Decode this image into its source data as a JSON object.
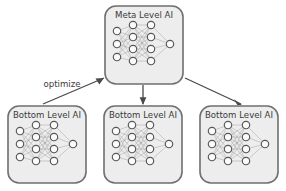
{
  "diagram": {
    "title_meta": "Meta Level AI",
    "edge_label_optimize": "optimize",
    "background_color": "#ffffff",
    "box_fill_color": "#ededed",
    "box_border_color": "#6f6f6f",
    "node_fill_color": "#fbfbfb",
    "node_border_color": "#575757",
    "link_color": "#9a9a9a",
    "arrow_color": "#4a4a4a",
    "text_color": "#3a3a3a",
    "boxes": [
      {
        "id": "meta",
        "label": "Meta Level AI",
        "x": 105,
        "y": 6,
        "width": 78,
        "height": 78,
        "network": {
          "layers": [
            3,
            4,
            4,
            1
          ]
        }
      },
      {
        "id": "bottom-left",
        "label": "Bottom Level AI",
        "x": 8,
        "y": 106,
        "width": 78,
        "height": 77,
        "network": {
          "layers": [
            3,
            4,
            4,
            1
          ]
        }
      },
      {
        "id": "bottom-center",
        "label": "Bottom Level AI",
        "x": 104,
        "y": 106,
        "width": 78,
        "height": 77,
        "network": {
          "layers": [
            3,
            4,
            4,
            1
          ]
        }
      },
      {
        "id": "bottom-right",
        "label": "Bottom Level AI",
        "x": 200,
        "y": 106,
        "width": 78,
        "height": 77,
        "network": {
          "layers": [
            3,
            4,
            4,
            1
          ]
        }
      }
    ],
    "arrows": [
      {
        "id": "arrow-optimize-left",
        "from": "bottom-left",
        "to": "meta",
        "label": "optimize",
        "direction": "up-right"
      },
      {
        "id": "arrow-meta-center",
        "from": "meta",
        "to": "bottom-center",
        "label": "",
        "direction": "down"
      },
      {
        "id": "arrow-meta-right",
        "from": "meta",
        "to": "bottom-right",
        "label": "",
        "direction": "down-right"
      }
    ]
  }
}
